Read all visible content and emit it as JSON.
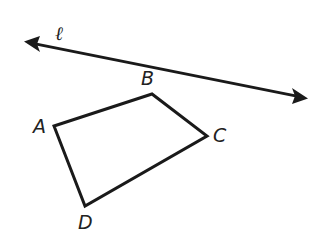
{
  "diagram": {
    "line": {
      "label": "ℓ",
      "from": [
        26,
        42
      ],
      "to": [
        306,
        98
      ]
    },
    "quadrilateral": {
      "vertices": [
        {
          "name": "A",
          "x": 54,
          "y": 126
        },
        {
          "name": "B",
          "x": 152,
          "y": 94
        },
        {
          "name": "C",
          "x": 207,
          "y": 136
        },
        {
          "name": "D",
          "x": 85,
          "y": 206
        }
      ]
    },
    "colors": {
      "stroke": "#1a1a1a",
      "background": "#ffffff"
    }
  }
}
